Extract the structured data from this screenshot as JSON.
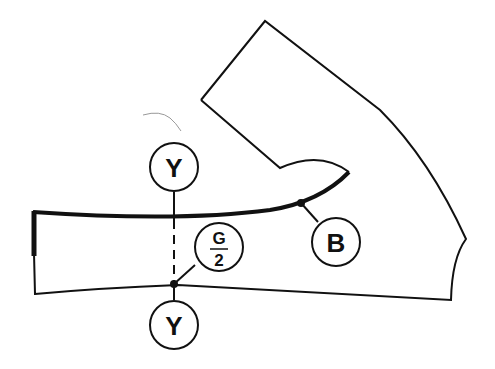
{
  "diagram": {
    "labels": {
      "y_top": "Y",
      "y_bottom": "Y",
      "g_numerator": "G",
      "g_denominator": "2",
      "b": "B"
    },
    "colors": {
      "line": "#111111",
      "background": "#ffffff",
      "stray_mark": "#999999"
    }
  }
}
